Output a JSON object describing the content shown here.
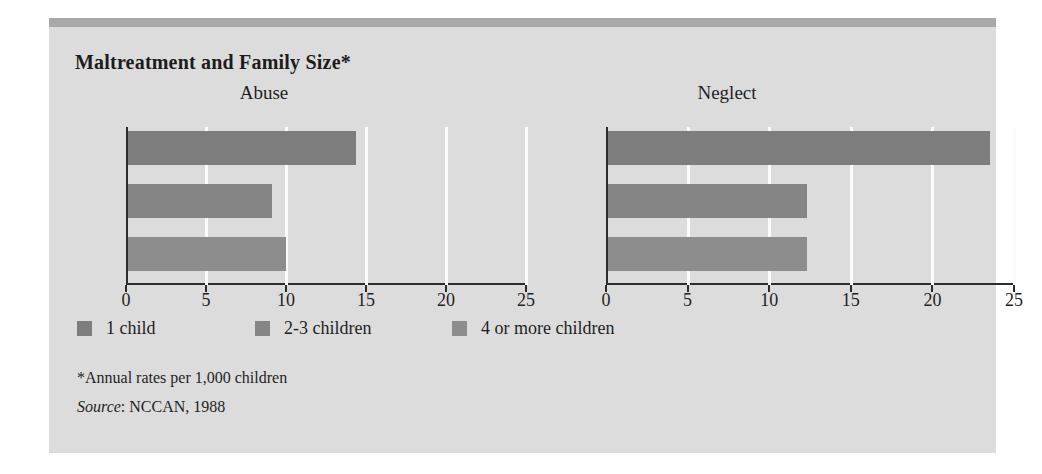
{
  "figure": {
    "title": "Maltreatment and Family Size*",
    "background_color": "#dcdcdc",
    "rule_color": "#a8a8a8",
    "bar_color": "#838383",
    "axis_color": "#2b2b2b",
    "gridline_color": "#fbfbfb",
    "footnote": "*Annual rates per 1,000 children",
    "source_word": "Source",
    "source_rest": ": NCCAN, 1988"
  },
  "legend": {
    "items": [
      {
        "label": "1 child",
        "color": "#7d7d7d"
      },
      {
        "label": "2-3 children",
        "color": "#858585"
      },
      {
        "label": "4 or more children",
        "color": "#8d8d8d"
      }
    ]
  },
  "chart_data": [
    {
      "type": "bar",
      "orientation": "horizontal",
      "title": "Abuse",
      "xlabel": "",
      "ylabel": "",
      "xlim": [
        0,
        25
      ],
      "xticks": [
        0,
        5,
        10,
        15,
        20,
        25
      ],
      "xtick_labels": [
        "0",
        "5",
        "10",
        "15",
        "20",
        "25"
      ],
      "grid": true,
      "legend_position": "below",
      "categories": [
        "1 child",
        "2-3 children",
        "4 or more children"
      ],
      "values": [
        14.4,
        9.1,
        10.0
      ],
      "units": "Annual rates per 1,000 children"
    },
    {
      "type": "bar",
      "orientation": "horizontal",
      "title": "Neglect",
      "xlabel": "",
      "ylabel": "",
      "xlim": [
        0,
        25
      ],
      "xticks": [
        0,
        5,
        10,
        15,
        20,
        25
      ],
      "xtick_labels": [
        "0",
        "5",
        "10",
        "15",
        "20",
        "25"
      ],
      "grid": true,
      "legend_position": "below",
      "categories": [
        "1 child",
        "2-3 children",
        "4 or more children"
      ],
      "values": [
        23.5,
        12.3,
        12.3
      ],
      "units": "Annual rates per 1,000 children"
    }
  ]
}
